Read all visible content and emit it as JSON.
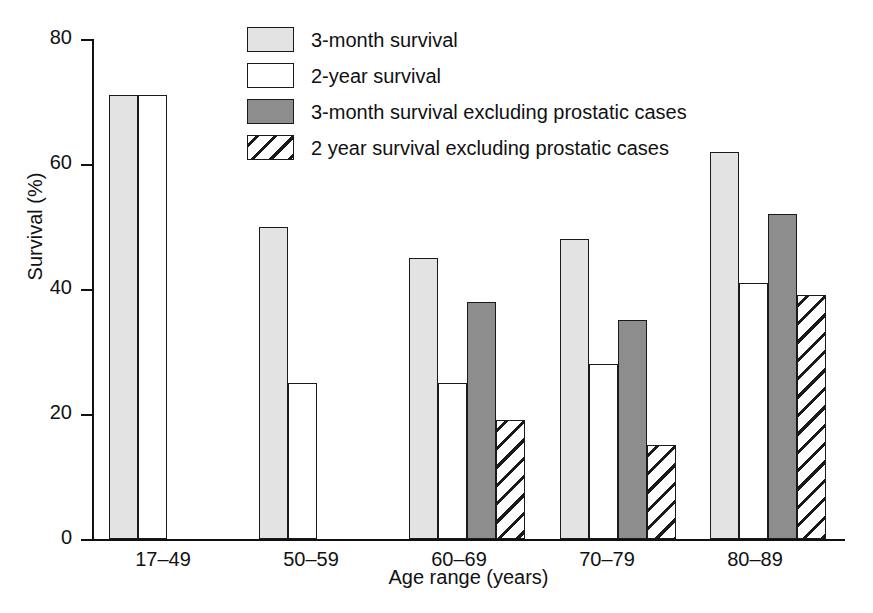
{
  "chart_data": {
    "type": "bar",
    "title": "",
    "xlabel": "Age range (years)",
    "ylabel": "Survival (%)",
    "categories": [
      "17–49",
      "50–59",
      "60–69",
      "70–79",
      "80–89"
    ],
    "ylim": [
      0,
      80
    ],
    "yticks": [
      0,
      20,
      40,
      60,
      80
    ],
    "ytick_labels": [
      "0",
      "20",
      "40",
      "60",
      "80"
    ],
    "grid": false,
    "legend_position": "top-center",
    "series": [
      {
        "name": "3-month survival",
        "style": "light-gray",
        "color": "#e3e3e3",
        "values": [
          71,
          50,
          45,
          48,
          62
        ]
      },
      {
        "name": "2-year survival",
        "style": "white",
        "color": "#ffffff",
        "values": [
          71,
          25,
          25,
          28,
          41
        ]
      },
      {
        "name": "3-month survival excluding prostatic cases",
        "style": "dark-gray",
        "color": "#8d8d8d",
        "values": [
          null,
          null,
          38,
          35,
          52
        ]
      },
      {
        "name": "2 year survival excluding prostatic cases",
        "style": "hatched",
        "color": "#ffffff",
        "values": [
          null,
          null,
          19,
          15,
          39
        ]
      }
    ]
  },
  "legend": {
    "items": [
      {
        "label": "3-month survival",
        "swatch": "light-gray-swatch"
      },
      {
        "label": "2-year survival",
        "swatch": "white-swatch"
      },
      {
        "label": "3-month survival excluding prostatic cases",
        "swatch": "dark-gray-swatch"
      },
      {
        "label": "2 year survival excluding prostatic cases",
        "swatch": "hatched-swatch"
      }
    ]
  },
  "axes": {
    "y_label": "Survival (%)",
    "x_label": "Age range (years)",
    "y_ticks": [
      "80",
      "60",
      "40",
      "20",
      "0"
    ],
    "x_ticks": [
      "17–49",
      "50–59",
      "60–69",
      "70–79",
      "80–89"
    ]
  },
  "colors": {
    "light_gray": "#e3e3e3",
    "dark_gray": "#8d8d8d",
    "white": "#ffffff",
    "outline": "#1a1a1a",
    "background": "#ffffff"
  }
}
